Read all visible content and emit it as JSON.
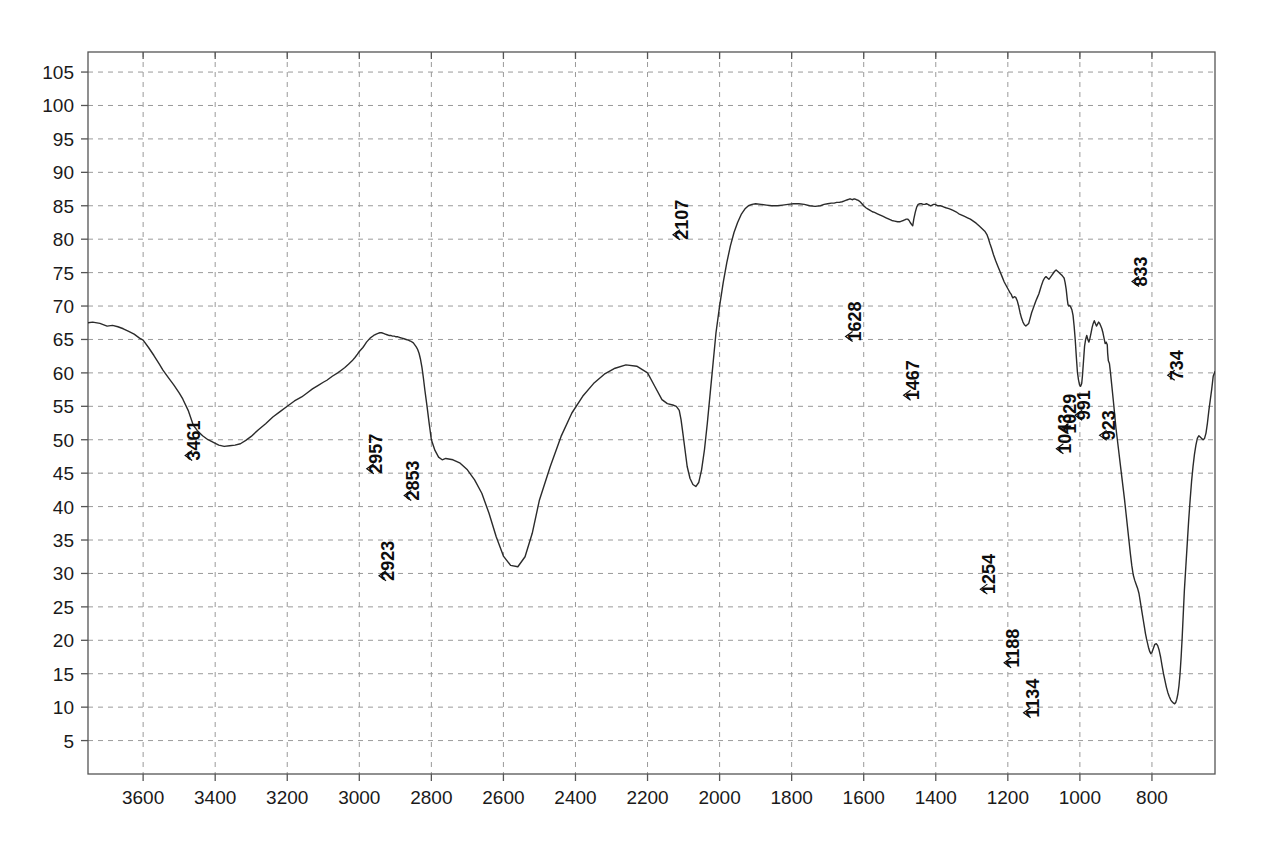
{
  "chart_data": {
    "type": "line",
    "title": "",
    "subtitle": "",
    "xlabel": "",
    "ylabel": "",
    "xlim": [
      3753,
      625
    ],
    "ylim": [
      0,
      108
    ],
    "x_tick_labels": [
      "3600",
      "3400",
      "3200",
      "3000",
      "2800",
      "2600",
      "2400",
      "2200",
      "2000",
      "1800",
      "1600",
      "1400",
      "1200",
      "1000",
      "800"
    ],
    "x_ticks": [
      3600,
      3400,
      3200,
      3000,
      2800,
      2600,
      2400,
      2200,
      2000,
      1800,
      1600,
      1400,
      1200,
      1000,
      800
    ],
    "y_tick_labels": [
      "5",
      "10",
      "15",
      "20",
      "25",
      "30",
      "35",
      "40",
      "45",
      "50",
      "55",
      "60",
      "65",
      "70",
      "75",
      "80",
      "85",
      "90",
      "95",
      "100",
      "105"
    ],
    "y_ticks": [
      5,
      10,
      15,
      20,
      25,
      30,
      35,
      40,
      45,
      50,
      55,
      60,
      65,
      70,
      75,
      80,
      85,
      90,
      95,
      100,
      105
    ],
    "grid": true,
    "grid_style": "dashed",
    "legend": "none",
    "line_color": "#2b2b2b",
    "grid_color": "#9a9a9a",
    "axis_color": "#555555",
    "annotations": [
      {
        "label": "3461",
        "x": 3461,
        "y": 49.0
      },
      {
        "label": "2957",
        "x": 2957,
        "y": 47.0
      },
      {
        "label": "2923",
        "x": 2923,
        "y": 31.0
      },
      {
        "label": "2853",
        "x": 2853,
        "y": 43.0
      },
      {
        "label": "2107",
        "x": 2107,
        "y": 82.0
      },
      {
        "label": "1628",
        "x": 1628,
        "y": 66.8
      },
      {
        "label": "1467",
        "x": 1467,
        "y": 58.0
      },
      {
        "label": "1254",
        "x": 1254,
        "y": 29.0
      },
      {
        "label": "1188",
        "x": 1188,
        "y": 18.0
      },
      {
        "label": "1134",
        "x": 1134,
        "y": 10.5
      },
      {
        "label": "1043",
        "x": 1043,
        "y": 50.0
      },
      {
        "label": "1029",
        "x": 1029,
        "y": 53.0
      },
      {
        "label": "991",
        "x": 991,
        "y": 55.0
      },
      {
        "label": "923",
        "x": 923,
        "y": 52.0
      },
      {
        "label": "833",
        "x": 833,
        "y": 75.0
      },
      {
        "label": "734",
        "x": 734,
        "y": 61.0
      }
    ],
    "x": [
      3753,
      3740,
      3720,
      3700,
      3685,
      3670,
      3655,
      3640,
      3625,
      3610,
      3600,
      3585,
      3570,
      3555,
      3545,
      3530,
      3515,
      3500,
      3490,
      3475,
      3461,
      3450,
      3435,
      3420,
      3405,
      3390,
      3375,
      3360,
      3345,
      3330,
      3315,
      3300,
      3280,
      3260,
      3240,
      3220,
      3200,
      3180,
      3160,
      3145,
      3130,
      3115,
      3100,
      3090,
      3075,
      3060,
      3050,
      3040,
      3030,
      3020,
      3012,
      3005,
      3000,
      2995,
      2990,
      2985,
      2980,
      2975,
      2970,
      2965,
      2960,
      2957,
      2953,
      2948,
      2943,
      2938,
      2933,
      2928,
      2923,
      2918,
      2913,
      2908,
      2903,
      2898,
      2893,
      2888,
      2882,
      2876,
      2870,
      2864,
      2860,
      2856,
      2853,
      2850,
      2846,
      2842,
      2838,
      2834,
      2830,
      2826,
      2822,
      2818,
      2812,
      2806,
      2800,
      2790,
      2780,
      2770,
      2760,
      2740,
      2720,
      2700,
      2680,
      2660,
      2640,
      2620,
      2600,
      2580,
      2560,
      2540,
      2520,
      2500,
      2470,
      2440,
      2410,
      2380,
      2350,
      2320,
      2290,
      2260,
      2230,
      2200,
      2180,
      2160,
      2145,
      2130,
      2120,
      2112,
      2107,
      2102,
      2096,
      2090,
      2082,
      2074,
      2066,
      2058,
      2050,
      2042,
      2034,
      2026,
      2018,
      2010,
      2000,
      1990,
      1980,
      1970,
      1960,
      1950,
      1940,
      1930,
      1920,
      1910,
      1900,
      1885,
      1870,
      1855,
      1840,
      1825,
      1810,
      1795,
      1780,
      1765,
      1750,
      1735,
      1720,
      1710,
      1700,
      1690,
      1682,
      1675,
      1668,
      1660,
      1655,
      1650,
      1645,
      1640,
      1636,
      1632,
      1628,
      1624,
      1620,
      1615,
      1610,
      1605,
      1600,
      1594,
      1588,
      1582,
      1576,
      1570,
      1562,
      1554,
      1546,
      1538,
      1530,
      1522,
      1514,
      1506,
      1500,
      1495,
      1490,
      1486,
      1482,
      1478,
      1474,
      1471,
      1467,
      1464,
      1461,
      1457,
      1453,
      1449,
      1444,
      1440,
      1435,
      1430,
      1426,
      1422,
      1418,
      1414,
      1410,
      1406,
      1402,
      1398,
      1394,
      1390,
      1386,
      1382,
      1377,
      1372,
      1366,
      1360,
      1352,
      1344,
      1336,
      1328,
      1320,
      1312,
      1304,
      1296,
      1288,
      1280,
      1272,
      1264,
      1258,
      1254,
      1250,
      1245,
      1240,
      1234,
      1228,
      1222,
      1216,
      1210,
      1204,
      1198,
      1194,
      1190,
      1188,
      1186,
      1182,
      1178,
      1174,
      1170,
      1166,
      1162,
      1158,
      1154,
      1150,
      1146,
      1142,
      1138,
      1134,
      1130,
      1126,
      1122,
      1118,
      1114,
      1110,
      1106,
      1102,
      1098,
      1094,
      1090,
      1086,
      1082,
      1078,
      1074,
      1070,
      1066,
      1062,
      1058,
      1054,
      1050,
      1047,
      1044,
      1043,
      1041,
      1038,
      1035,
      1033,
      1031,
      1029,
      1027,
      1025,
      1022,
      1019,
      1016,
      1013,
      1010,
      1007,
      1004,
      1001,
      998,
      995,
      993,
      991,
      989,
      987,
      984,
      981,
      978,
      975,
      972,
      969,
      966,
      963,
      960,
      957,
      954,
      951,
      948,
      945,
      942,
      939,
      936,
      933,
      930,
      927,
      924,
      923,
      921,
      918,
      915,
      912,
      909,
      906,
      903,
      900,
      896,
      892,
      888,
      884,
      880,
      876,
      872,
      868,
      864,
      860,
      856,
      852,
      848,
      844,
      840,
      836,
      833,
      830,
      827,
      824,
      821,
      818,
      815,
      812,
      809,
      806,
      803,
      800,
      796,
      792,
      788,
      784,
      780,
      776,
      772,
      768,
      764,
      760,
      756,
      752,
      748,
      744,
      740,
      737,
      734,
      731,
      728,
      725,
      722,
      719,
      716,
      713,
      710,
      706,
      702,
      698,
      694,
      690,
      686,
      682,
      678,
      674,
      670,
      666,
      662,
      658,
      654,
      650,
      646,
      642,
      638,
      634,
      630,
      625
    ],
    "y": [
      67.5,
      67.6,
      67.4,
      67.0,
      67.1,
      66.9,
      66.6,
      66.2,
      65.8,
      65.2,
      64.9,
      63.8,
      62.6,
      61.3,
      60.4,
      59.3,
      58.2,
      57.0,
      56.1,
      54.4,
      52.2,
      51.4,
      50.6,
      50.0,
      49.6,
      49.2,
      49.0,
      49.1,
      49.2,
      49.4,
      49.9,
      50.5,
      51.5,
      52.4,
      53.4,
      54.2,
      55.0,
      55.8,
      56.4,
      57.0,
      57.6,
      58.1,
      58.6,
      58.9,
      59.5,
      60.0,
      60.4,
      60.8,
      61.3,
      61.8,
      62.3,
      62.8,
      63.2,
      63.5,
      63.8,
      64.2,
      64.6,
      64.9,
      65.2,
      65.4,
      65.6,
      65.7,
      65.8,
      65.9,
      66.0,
      66.0,
      65.9,
      65.8,
      65.7,
      65.6,
      65.6,
      65.5,
      65.5,
      65.4,
      65.4,
      65.3,
      65.2,
      65.1,
      65.0,
      64.9,
      64.8,
      64.7,
      64.6,
      64.5,
      64.2,
      63.9,
      63.5,
      62.9,
      62.0,
      60.8,
      59.2,
      57.4,
      55.0,
      52.4,
      50.0,
      48.4,
      47.4,
      47.0,
      47.2,
      47.0,
      46.5,
      45.5,
      44.0,
      42.0,
      39.0,
      35.5,
      32.6,
      31.2,
      31.0,
      32.5,
      36.0,
      41.0,
      46.0,
      50.5,
      54.0,
      56.5,
      58.4,
      59.8,
      60.7,
      61.2,
      61.0,
      60.0,
      58.0,
      56.0,
      55.4,
      55.2,
      55.0,
      54.4,
      53.0,
      51.0,
      48.5,
      46.0,
      44.2,
      43.3,
      43.0,
      43.6,
      45.5,
      48.5,
      52.5,
      57.0,
      61.5,
      66.0,
      70.0,
      73.5,
      76.5,
      79.0,
      81.0,
      82.5,
      83.7,
      84.5,
      85.0,
      85.2,
      85.3,
      85.2,
      85.1,
      85.0,
      85.0,
      85.1,
      85.2,
      85.3,
      85.3,
      85.2,
      85.0,
      84.9,
      85.0,
      85.2,
      85.3,
      85.4,
      85.4,
      85.5,
      85.5,
      85.6,
      85.7,
      85.8,
      85.9,
      86.0,
      86.0,
      85.9,
      86.0,
      86.0,
      85.9,
      85.8,
      85.6,
      85.3,
      85.0,
      84.7,
      84.5,
      84.3,
      84.1,
      84.0,
      83.8,
      83.6,
      83.4,
      83.2,
      83.0,
      82.8,
      82.7,
      82.6,
      82.6,
      82.7,
      82.8,
      82.9,
      83.0,
      83.0,
      82.8,
      82.5,
      82.2,
      82.0,
      83.0,
      84.0,
      84.8,
      85.2,
      85.3,
      85.3,
      85.2,
      85.2,
      85.3,
      85.2,
      85.1,
      85.0,
      85.1,
      85.2,
      85.2,
      85.1,
      85.0,
      85.0,
      85.0,
      84.9,
      84.8,
      84.7,
      84.6,
      84.5,
      84.3,
      84.1,
      83.8,
      83.6,
      83.4,
      83.2,
      83.0,
      82.7,
      82.4,
      82.0,
      81.6,
      81.2,
      80.7,
      80.1,
      79.4,
      78.6,
      77.7,
      76.8,
      76.0,
      75.2,
      74.4,
      73.6,
      73.0,
      72.4,
      72.0,
      71.7,
      71.4,
      71.2,
      71.4,
      71.3,
      70.8,
      70.0,
      69.0,
      68.2,
      67.6,
      67.2,
      67.0,
      67.2,
      67.4,
      68.2,
      69.0,
      69.6,
      70.2,
      70.8,
      71.3,
      71.8,
      72.5,
      73.2,
      73.8,
      74.2,
      74.4,
      74.2,
      74.0,
      74.3,
      74.6,
      74.9,
      75.2,
      75.4,
      75.2,
      75.0,
      74.8,
      74.6,
      74.4,
      74.2,
      74.0,
      73.5,
      72.5,
      71.0,
      70.2,
      70.0,
      70.1,
      70.0,
      69.8,
      69.4,
      68.6,
      67.0,
      65.0,
      62.5,
      60.2,
      59.0,
      58.2,
      58.0,
      58.4,
      59.5,
      61.0,
      62.5,
      64.0,
      65.0,
      65.6,
      65.0,
      64.6,
      65.2,
      66.0,
      66.8,
      67.4,
      67.8,
      67.4,
      67.0,
      67.3,
      67.6,
      67.4,
      67.0,
      66.6,
      66.0,
      65.2,
      64.4,
      64.6,
      64.2,
      63.0,
      61.8,
      61.4,
      60.0,
      58.4,
      56.8,
      55.2,
      53.5,
      51.8,
      50.0,
      48.2,
      46.4,
      44.6,
      42.8,
      41.0,
      39.0,
      37.0,
      35.0,
      33.0,
      31.2,
      29.8,
      29.0,
      28.4,
      27.8,
      27.0,
      26.0,
      25.0,
      24.0,
      23.0,
      22.0,
      21.0,
      20.2,
      19.5,
      18.8,
      18.3,
      18.0,
      18.2,
      18.8,
      19.4,
      19.5,
      19.2,
      18.5,
      17.5,
      16.2,
      15.0,
      14.0,
      13.0,
      12.2,
      11.6,
      11.1,
      10.8,
      10.6,
      10.5,
      10.7,
      11.2,
      12.0,
      13.2,
      15.0,
      17.5,
      20.5,
      24.0,
      27.5,
      31.0,
      34.5,
      38.0,
      41.0,
      43.8,
      46.0,
      47.8,
      49.2,
      50.2,
      50.6,
      50.4,
      50.2,
      50.0,
      50.2,
      51.0,
      52.5,
      54.4,
      56.0,
      57.6,
      59.5,
      60.2,
      58.5,
      56.0,
      54.2,
      53.2,
      53.0,
      53.6,
      54.8,
      56.6,
      58.8,
      60.8,
      62.5,
      64.0,
      64.6,
      64.2,
      63.2,
      62.6,
      63.0,
      63.6,
      64.4,
      64.8,
      64.6,
      64.6,
      65.0,
      65.6,
      65.2,
      64.8,
      64.6,
      64.8,
      65.2,
      65.0,
      64.4,
      63.4,
      62.0,
      60.5,
      59.0,
      58.0,
      57.4,
      57.2,
      57.6,
      58.6,
      60.2,
      62.0,
      63.8,
      65.4,
      66.8,
      68.0,
      68.8,
      69.4,
      69.6,
      69.2,
      68.4,
      67.5,
      66.5,
      65.2,
      63.8,
      62.4,
      61.0,
      59.2,
      57.4,
      55.6,
      54.0,
      52.8,
      52.2,
      52.0,
      52.6,
      54.0,
      56.5,
      59.5,
      62.5,
      65.5,
      68.0,
      70.0,
      72.0,
      74.0,
      76.0,
      78.0,
      80.0,
      82.0,
      84.0,
      86.0,
      88.0,
      89.8,
      90.8,
      91.2,
      90.0,
      88.0,
      85.5,
      82.5,
      79.5,
      77.2,
      75.6,
      75.0,
      75.4,
      76.5,
      78.5,
      81.0,
      84.0,
      87.0,
      89.5,
      91.5,
      93.2,
      94.5,
      95.2,
      95.0,
      94.5,
      94.2,
      94.6,
      95.5,
      97.0,
      98.5,
      99.5,
      100.0,
      99.5,
      98.5,
      97.5,
      96.5,
      95.8,
      95.2,
      94.8,
      94.4,
      94.0,
      93.5,
      93.5,
      94.0,
      94.5,
      94.0,
      92.5,
      90.0,
      86.5,
      82.5,
      78.0,
      73.5,
      69.5,
      66.0,
      63.5,
      62.0,
      61.2,
      61.0,
      61.6,
      63.0,
      65.5,
      69.0,
      73.0,
      77.0,
      81.0,
      84.5,
      88.0,
      90.5,
      92.5,
      94.0,
      95.2,
      96.0,
      96.5,
      96.4,
      95.5,
      94.0,
      92.0,
      89.5,
      87.0,
      85.5,
      85.0,
      84.8,
      84.6,
      84.4,
      84.2,
      84.0,
      83.4,
      82.4,
      81.0,
      79.4,
      77.6,
      76.0,
      75.2,
      75.0
    ]
  },
  "axes": {
    "x_axis_name": "wavenumber-axis",
    "y_axis_name": "transmittance-axis"
  }
}
